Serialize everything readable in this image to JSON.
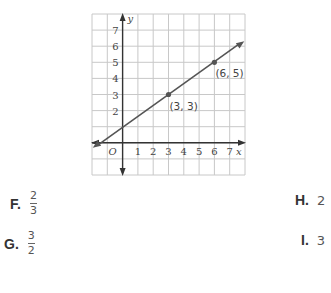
{
  "graph": {
    "x_axis_label": "x",
    "y_axis_label": "y",
    "origin_label": "O",
    "x_range": [
      -2,
      8
    ],
    "y_range": [
      -2,
      8
    ],
    "x_tick_labels": [
      "1",
      "2",
      "3",
      "4",
      "5",
      "6",
      "7"
    ],
    "y_tick_labels": [
      "2",
      "3",
      "4",
      "5",
      "6",
      "7"
    ],
    "points": [
      {
        "x": 3,
        "y": 3,
        "label": "(3, 3)"
      },
      {
        "x": 6,
        "y": 5,
        "label": "(6, 5)"
      }
    ],
    "line": {
      "slope_num": 2,
      "slope_den": 3,
      "intercept": 1
    },
    "grid_color": "#c8c8c8",
    "line_color": "#555555"
  },
  "chart_data": {
    "type": "line",
    "title": "",
    "xlabel": "x",
    "ylabel": "y",
    "xlim": [
      -2,
      8
    ],
    "ylim": [
      -2,
      8
    ],
    "grid": true,
    "series": [
      {
        "name": "line",
        "x": [
          -2,
          8
        ],
        "y": [
          -0.333,
          6.333
        ]
      }
    ],
    "annotations": [
      "(3, 3)",
      "(6, 5)"
    ]
  },
  "choices": [
    {
      "letter": "F.",
      "numerator": "2",
      "denominator": "3"
    },
    {
      "letter": "G.",
      "numerator": "3",
      "denominator": "2"
    },
    {
      "letter": "H.",
      "value": "2"
    },
    {
      "letter": "I.",
      "value": "3"
    }
  ]
}
